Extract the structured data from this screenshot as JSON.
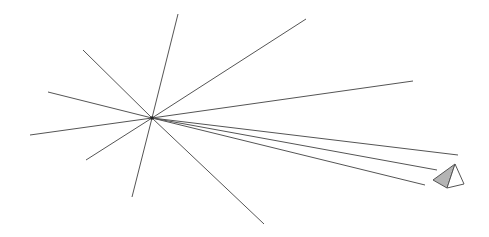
{
  "diagram": {
    "width": 489,
    "height": 237,
    "background": "#ffffff",
    "stroke_color": "#555555",
    "center": {
      "x": 152,
      "y": 118
    },
    "rays": [
      {
        "x": 178,
        "y": 14
      },
      {
        "x": 306,
        "y": 19
      },
      {
        "x": 413,
        "y": 81
      },
      {
        "x": 83,
        "y": 50
      },
      {
        "x": 48,
        "y": 92
      },
      {
        "x": 30,
        "y": 135
      },
      {
        "x": 86,
        "y": 160
      },
      {
        "x": 132,
        "y": 197
      },
      {
        "x": 264,
        "y": 224
      },
      {
        "x": 458,
        "y": 155
      },
      {
        "x": 437,
        "y": 170
      },
      {
        "x": 425,
        "y": 185
      }
    ],
    "pyramid": {
      "apex": {
        "x": 455,
        "y": 164
      },
      "left": {
        "x": 433,
        "y": 180
      },
      "bottom": {
        "x": 447,
        "y": 188
      },
      "right": {
        "x": 464,
        "y": 184
      },
      "shaded_face_color": "#b4b4b4",
      "light_face_color": "#ffffff"
    }
  }
}
